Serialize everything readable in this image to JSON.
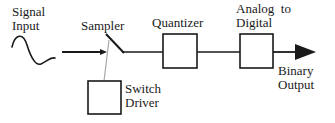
{
  "diagram": {
    "background_color": "#ffffff",
    "stroke_color": "#1a1a1a",
    "connector_color": "#9a9a9a",
    "labels": {
      "signal_input": "Signal\nInput",
      "sampler": "Sampler",
      "quantizer": "Quantizer",
      "analog_to_digital": "Analog  to\nDigital",
      "switch_driver": "Switch\nDriver",
      "binary_output": "Binary\nOutput"
    },
    "blocks": [
      {
        "name": "quantizer",
        "label": "Quantizer",
        "x": 163,
        "y": 34,
        "width": 34,
        "height": 34
      },
      {
        "name": "analog-to-digital",
        "label": "Analog  to Digital",
        "x": 240,
        "y": 34,
        "width": 33,
        "height": 34
      },
      {
        "name": "switch-driver",
        "label": "Switch Driver",
        "x": 88,
        "y": 81,
        "width": 33,
        "height": 33
      }
    ],
    "signal_waveform": {
      "name": "sine-wave",
      "description": "analog input sine wave",
      "path": "M 12 47 C 15 34, 23 32, 27 45 C 31 58, 36 66, 41 64 C 46 62, 50 57, 55 58"
    },
    "wires": [
      {
        "name": "input-arrow",
        "from_x": 62,
        "from_y": 52,
        "to_x": 106,
        "to_y": 52,
        "arrow": true
      },
      {
        "name": "sampler-to-quantizer",
        "from_x": 122,
        "from_y": 52,
        "to_x": 163,
        "to_y": 52,
        "arrow": false
      },
      {
        "name": "quantizer-to-adc",
        "from_x": 197,
        "from_y": 52,
        "to_x": 240,
        "to_y": 52,
        "arrow": false
      },
      {
        "name": "adc-to-output",
        "from_x": 273,
        "from_y": 52,
        "to_x": 316,
        "to_y": 52,
        "arrow": true
      },
      {
        "name": "switch-blade",
        "from_x": 106,
        "from_y": 35,
        "to_x": 123,
        "to_y": 53,
        "arrow": false
      },
      {
        "name": "driver-control-line",
        "from_x": 107,
        "from_y": 52,
        "to_x": 104,
        "to_y": 81,
        "arrow": false
      }
    ]
  }
}
